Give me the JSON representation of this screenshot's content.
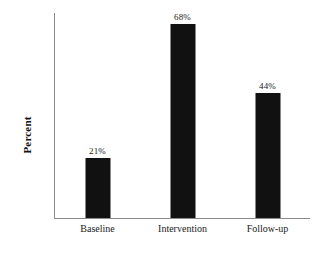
{
  "chart_data": {
    "type": "bar",
    "title": "",
    "subtitle": "",
    "xlabel": "",
    "ylabel": "Percent",
    "categories": [
      "Baseline",
      "Intervention",
      "Follow-up"
    ],
    "values": [
      21,
      68,
      44
    ],
    "data_labels": [
      "21%",
      "68%",
      "44%"
    ],
    "ylim": [
      0,
      72
    ],
    "grid": false,
    "legend": false,
    "legend_position": "none",
    "y_tick_labels": [],
    "bar_color": "#111111",
    "axis_color": "#8a8a8a",
    "background_color": "#ffffff",
    "text_color": "#1a1a1a"
  }
}
